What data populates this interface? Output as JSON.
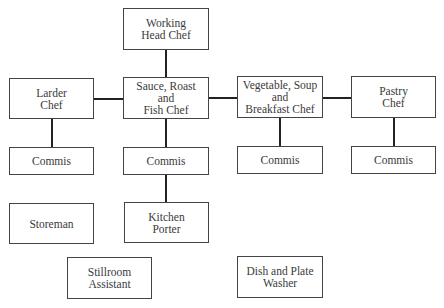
{
  "chart": {
    "nodes": {
      "head_chef": "Working\nHead Chef",
      "larder_chef": "Larder\nChef",
      "sauce_chef": "Sauce, Roast\nand\nFish Chef",
      "veg_chef": "Vegetable, Soup\nand\nBreakfast Chef",
      "pastry_chef": "Pastry\nChef",
      "commis_larder": "Commis",
      "commis_sauce": "Commis",
      "commis_veg": "Commis",
      "commis_pastry": "Commis",
      "storeman": "Storeman",
      "kitchen_porter": "Kitchen\nPorter",
      "stillroom_assistant": "Stillroom\nAssistant",
      "dish_washer": "Dish and Plate\nWasher"
    },
    "edges": [
      [
        "head_chef",
        "sauce_chef"
      ],
      [
        "larder_chef",
        "sauce_chef"
      ],
      [
        "sauce_chef",
        "veg_chef"
      ],
      [
        "veg_chef",
        "pastry_chef"
      ],
      [
        "larder_chef",
        "commis_larder"
      ],
      [
        "sauce_chef",
        "commis_sauce"
      ],
      [
        "veg_chef",
        "commis_veg"
      ],
      [
        "pastry_chef",
        "commis_pastry"
      ],
      [
        "commis_sauce",
        "kitchen_porter"
      ]
    ]
  }
}
